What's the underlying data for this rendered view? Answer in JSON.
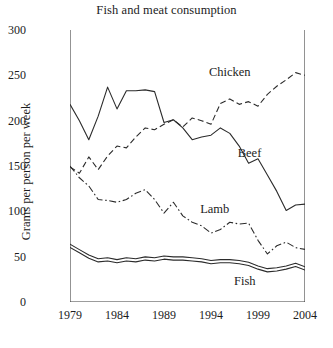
{
  "chart_data": {
    "type": "line",
    "title": "Fish and meat consumption",
    "xlabel": "",
    "ylabel": "Grams per person per week",
    "x": [
      1979,
      1980,
      1981,
      1982,
      1983,
      1984,
      1985,
      1986,
      1987,
      1988,
      1989,
      1990,
      1991,
      1992,
      1993,
      1994,
      1995,
      1996,
      1997,
      1998,
      1999,
      2000,
      2001,
      2002,
      2003,
      2004
    ],
    "xlim": [
      1979,
      2004
    ],
    "ylim": [
      0,
      300
    ],
    "xticks": [
      1979,
      1984,
      1989,
      1994,
      1999,
      2004
    ],
    "xtick_labels": [
      "1979",
      "1984",
      "1989",
      "1994",
      "1999",
      "2004"
    ],
    "yticks": [
      0,
      50,
      100,
      150,
      200,
      250,
      300
    ],
    "ytick_labels": [
      "0",
      "50",
      "100",
      "150",
      "200",
      "250",
      "300"
    ],
    "xminor_ticks": [
      1980,
      1981,
      1982,
      1983,
      1985,
      1986,
      1987,
      1988,
      1990,
      1991,
      1992,
      1993,
      1995,
      1996,
      1997,
      1998,
      2000,
      2001,
      2002,
      2003
    ],
    "grid": false,
    "legend_position": "inline-annotations",
    "series": [
      {
        "name": "Beef",
        "style": "solid",
        "color": "#2b2b2b",
        "label_x": 1998.1,
        "label_y": 163,
        "values": [
          218,
          200,
          179,
          205,
          237,
          213,
          233,
          233,
          234,
          232,
          198,
          201,
          192,
          179,
          182,
          184,
          192,
          186,
          172,
          153,
          158,
          140,
          122,
          101,
          107,
          108
        ]
      },
      {
        "name": "Chicken",
        "style": "dashed",
        "color": "#2b2b2b",
        "label_x": 1996.0,
        "label_y": 253,
        "values": [
          149,
          142,
          160,
          146,
          161,
          172,
          170,
          182,
          192,
          190,
          196,
          201,
          193,
          203,
          200,
          196,
          219,
          224,
          218,
          221,
          216,
          229,
          238,
          245,
          253,
          250
        ]
      },
      {
        "name": "Lamb",
        "style": "dashdot",
        "color": "#2b2b2b",
        "label_x": 1994.4,
        "label_y": 101,
        "values": [
          150,
          137,
          128,
          113,
          112,
          110,
          113,
          120,
          124,
          113,
          98,
          110,
          95,
          88,
          84,
          76,
          80,
          88,
          86,
          87,
          68,
          53,
          62,
          66,
          60,
          58
        ]
      },
      {
        "name": "Fish",
        "style": "band",
        "color": "#2b2b2b",
        "label_x": 1997.6,
        "label_y": 22,
        "values": [
          62,
          56,
          50,
          46,
          47,
          45,
          47,
          46,
          48,
          47,
          49,
          48,
          48,
          47,
          46,
          44,
          45,
          45,
          44,
          42,
          38,
          35,
          36,
          38,
          41,
          37
        ]
      }
    ]
  }
}
